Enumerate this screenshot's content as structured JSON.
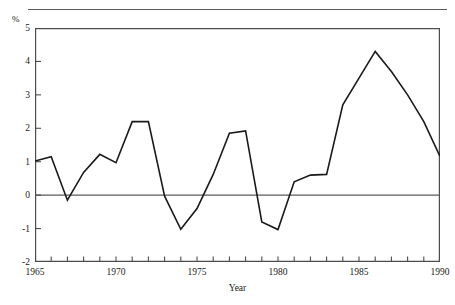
{
  "figure": {
    "y_unit_label": "%",
    "x_axis_title": "Year",
    "line_color": "#1a1a1a",
    "axis_color": "#4d4d4d",
    "zero_line_color": "#5a5a5a",
    "rule_color": "#5a5a5a"
  },
  "chart_data": {
    "type": "line",
    "title": "",
    "subtitle": "",
    "xlabel": "Year",
    "ylabel": "%",
    "ylim": [
      -2,
      5
    ],
    "xlim": [
      1965,
      1990
    ],
    "grid": false,
    "legend": null,
    "y_unit": "%",
    "y_ticks": [
      5,
      4,
      3,
      2,
      1,
      0,
      -1,
      -2
    ],
    "y_tick_labels": [
      "5",
      "4",
      "3",
      "2",
      "1",
      "0",
      "-1",
      "-2"
    ],
    "x_ticks": [
      1965,
      1966,
      1967,
      1968,
      1969,
      1970,
      1971,
      1972,
      1973,
      1974,
      1975,
      1976,
      1977,
      1978,
      1979,
      1980,
      1981,
      1982,
      1983,
      1984,
      1985,
      1986,
      1987,
      1988,
      1989,
      1990
    ],
    "x_tick_labels_shown": [
      "1965",
      "1970",
      "1975",
      "1980",
      "1985",
      "1990"
    ],
    "x_labeled_ticks": [
      1965,
      1970,
      1975,
      1980,
      1985,
      1990
    ],
    "zero_reference_line": 0,
    "x": [
      1965,
      1966,
      1967,
      1968,
      1969,
      1970,
      1971,
      1972,
      1973,
      1974,
      1975,
      1976,
      1977,
      1978,
      1979,
      1980,
      1981,
      1982,
      1983,
      1984,
      1985,
      1986,
      1987,
      1988,
      1989,
      1990
    ],
    "values": [
      1.02,
      1.15,
      -0.15,
      0.68,
      1.22,
      0.97,
      2.2,
      2.2,
      -0.03,
      -1.02,
      -0.4,
      0.62,
      1.85,
      1.92,
      -0.8,
      -1.03,
      0.4,
      0.6,
      0.62,
      2.7,
      3.5,
      4.3,
      3.7,
      3.0,
      2.2,
      1.16
    ],
    "series": [
      {
        "name": "",
        "values": [
          1.02,
          1.15,
          -0.15,
          0.68,
          1.22,
          0.97,
          2.2,
          2.2,
          -0.03,
          -1.02,
          -0.4,
          0.62,
          1.85,
          1.92,
          -0.8,
          -1.03,
          0.4,
          0.6,
          0.62,
          2.7,
          3.5,
          4.3,
          3.7,
          3.0,
          2.2,
          1.16
        ]
      }
    ]
  }
}
